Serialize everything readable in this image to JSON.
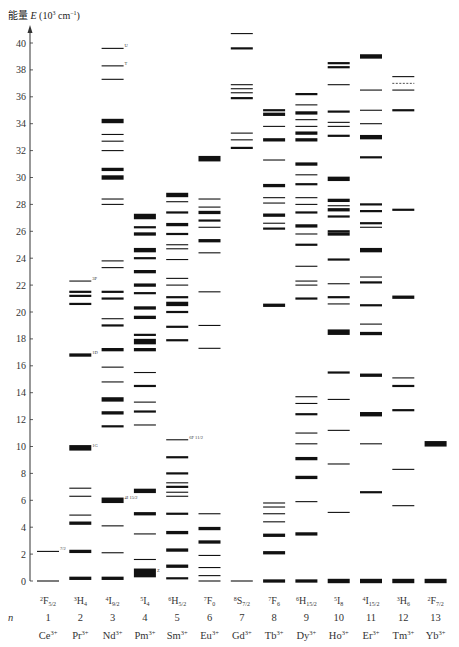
{
  "chart_data": {
    "type": "diagram",
    "ylabel": "能量 E (10^3 cm^-1)",
    "ylabel_parts": {
      "prefix": "能量",
      "var": "E",
      "unit": "(10",
      "exp": "3",
      "unit2": " cm",
      "exp2": "−1",
      "close": ")"
    },
    "ylim": [
      0,
      41
    ],
    "yticks": [
      0,
      2,
      4,
      6,
      8,
      10,
      12,
      14,
      16,
      18,
      20,
      22,
      24,
      26,
      28,
      30,
      32,
      34,
      36,
      38,
      40
    ],
    "row_n_label": "n",
    "ions": [
      {
        "n": "1",
        "ion": "Ce",
        "charge": "3+",
        "ground": "2F",
        "ground_sub": "5/2",
        "levels": [
          {
            "E": 0,
            "w": 1
          },
          {
            "E": 2.2,
            "w": 1,
            "label": "7/2"
          }
        ]
      },
      {
        "n": "2",
        "ion": "Pr",
        "charge": "3+",
        "ground": "3H",
        "ground_sub": "4",
        "levels": [
          {
            "E": 0.2,
            "w": 3
          },
          {
            "E": 2.2,
            "w": 3
          },
          {
            "E": 4.3,
            "w": 3
          },
          {
            "E": 4.9,
            "w": 1
          },
          {
            "E": 6.3,
            "w": 1
          },
          {
            "E": 6.9,
            "w": 1
          },
          {
            "E": 9.9,
            "w": 5,
            "label": "1G"
          },
          {
            "E": 16.8,
            "w": 3,
            "label": "1D"
          },
          {
            "E": 20.6,
            "w": 2
          },
          {
            "E": 21.2,
            "w": 2
          },
          {
            "E": 21.5,
            "w": 2
          },
          {
            "E": 22.3,
            "w": 1,
            "label": "3P"
          },
          {
            "E": 46,
            "w": 1
          }
        ]
      },
      {
        "n": "3",
        "ion": "Nd",
        "charge": "3+",
        "ground": "4I",
        "ground_sub": "9/2",
        "levels": [
          {
            "E": 0.2,
            "w": 3
          },
          {
            "E": 2.1,
            "w": 1
          },
          {
            "E": 4.1,
            "w": 1
          },
          {
            "E": 6.0,
            "w": 5,
            "label": "4I 15/2"
          },
          {
            "E": 11.5,
            "w": 2
          },
          {
            "E": 12.5,
            "w": 3
          },
          {
            "E": 13.5,
            "w": 4
          },
          {
            "E": 14.8,
            "w": 1
          },
          {
            "E": 15.9,
            "w": 1
          },
          {
            "E": 17.2,
            "w": 3
          },
          {
            "E": 19.0,
            "w": 2
          },
          {
            "E": 19.5,
            "w": 1
          },
          {
            "E": 21.0,
            "w": 2
          },
          {
            "E": 21.5,
            "w": 2
          },
          {
            "E": 23.3,
            "w": 1
          },
          {
            "E": 23.8,
            "w": 1
          },
          {
            "E": 28.0,
            "w": 1
          },
          {
            "E": 28.4,
            "w": 1
          },
          {
            "E": 30.0,
            "w": 4
          },
          {
            "E": 30.6,
            "w": 3
          },
          {
            "E": 32.0,
            "w": 1
          },
          {
            "E": 32.7,
            "w": 1
          },
          {
            "E": 33.2,
            "w": 1
          },
          {
            "E": 34.2,
            "w": 4
          },
          {
            "E": 37.3,
            "w": 1
          },
          {
            "E": 38.3,
            "w": 1,
            "label": "T"
          },
          {
            "E": 39.6,
            "w": 1,
            "label": "U"
          }
        ]
      },
      {
        "n": "4",
        "ion": "Pm",
        "charge": "3+",
        "ground": "5I",
        "ground_sub": "4",
        "levels": [
          {
            "E": 0.6,
            "w": 8,
            "label": "Z"
          },
          {
            "E": 1.6,
            "w": 1
          },
          {
            "E": 3.5,
            "w": 1
          },
          {
            "E": 5.0,
            "w": 3
          },
          {
            "E": 6.7,
            "w": 4
          },
          {
            "E": 11.6,
            "w": 1
          },
          {
            "E": 12.6,
            "w": 2
          },
          {
            "E": 13.3,
            "w": 1
          },
          {
            "E": 14.5,
            "w": 2
          },
          {
            "E": 15.5,
            "w": 1
          },
          {
            "E": 17.2,
            "w": 3
          },
          {
            "E": 17.8,
            "w": 5
          },
          {
            "E": 18.3,
            "w": 2
          },
          {
            "E": 19.6,
            "w": 3
          },
          {
            "E": 20.3,
            "w": 3
          },
          {
            "E": 21.4,
            "w": 2
          },
          {
            "E": 22.0,
            "w": 3
          },
          {
            "E": 23.0,
            "w": 3
          },
          {
            "E": 24.0,
            "w": 2
          },
          {
            "E": 24.6,
            "w": 4
          },
          {
            "E": 25.8,
            "w": 3
          },
          {
            "E": 26.3,
            "w": 2
          },
          {
            "E": 27.1,
            "w": 5
          }
        ]
      },
      {
        "n": "5",
        "ion": "Sm",
        "charge": "3+",
        "ground": "6H",
        "ground_sub": "5/2",
        "levels": [
          {
            "E": 0.2,
            "w": 2
          },
          {
            "E": 1.1,
            "w": 3
          },
          {
            "E": 2.3,
            "w": 3
          },
          {
            "E": 3.6,
            "w": 3
          },
          {
            "E": 5.0,
            "w": 2
          },
          {
            "E": 6.3,
            "w": 1
          },
          {
            "E": 6.6,
            "w": 1
          },
          {
            "E": 7.0,
            "w": 2
          },
          {
            "E": 7.3,
            "w": 1
          },
          {
            "E": 8.0,
            "w": 2
          },
          {
            "E": 9.2,
            "w": 2
          },
          {
            "E": 10.5,
            "w": 1,
            "label": "6F 11/2"
          },
          {
            "E": 17.9,
            "w": 2
          },
          {
            "E": 18.9,
            "w": 2
          },
          {
            "E": 20.0,
            "w": 2
          },
          {
            "E": 20.6,
            "w": 4
          },
          {
            "E": 21.1,
            "w": 2
          },
          {
            "E": 22.0,
            "w": 1
          },
          {
            "E": 22.5,
            "w": 1
          },
          {
            "E": 23.9,
            "w": 1
          },
          {
            "E": 24.7,
            "w": 1
          },
          {
            "E": 25.0,
            "w": 1
          },
          {
            "E": 25.8,
            "w": 2
          },
          {
            "E": 26.5,
            "w": 3
          },
          {
            "E": 27.4,
            "w": 2
          },
          {
            "E": 28.2,
            "w": 1
          },
          {
            "E": 28.7,
            "w": 4
          }
        ]
      },
      {
        "n": "6",
        "ion": "Eu",
        "charge": "3+",
        "ground": "7F",
        "ground_sub": "0",
        "levels": [
          {
            "E": 0,
            "w": 1
          },
          {
            "E": 0.4,
            "w": 1
          },
          {
            "E": 1.0,
            "w": 1
          },
          {
            "E": 1.9,
            "w": 1
          },
          {
            "E": 2.9,
            "w": 3
          },
          {
            "E": 3.9,
            "w": 3
          },
          {
            "E": 5.0,
            "w": 1
          },
          {
            "E": 17.3,
            "w": 1
          },
          {
            "E": 19.0,
            "w": 1
          },
          {
            "E": 21.5,
            "w": 1
          },
          {
            "E": 24.4,
            "w": 1
          },
          {
            "E": 25.3,
            "w": 3
          },
          {
            "E": 26.3,
            "w": 1
          },
          {
            "E": 26.8,
            "w": 2
          },
          {
            "E": 27.4,
            "w": 3
          },
          {
            "E": 27.8,
            "w": 1
          },
          {
            "E": 28.4,
            "w": 1
          },
          {
            "E": 31.4,
            "w": 5
          }
        ]
      },
      {
        "n": "7",
        "ion": "Gd",
        "charge": "3+",
        "ground": "8S",
        "ground_sub": "7/2",
        "levels": [
          {
            "E": 0,
            "w": 1
          },
          {
            "E": 32.2,
            "w": 2
          },
          {
            "E": 32.8,
            "w": 1
          },
          {
            "E": 33.3,
            "w": 1
          },
          {
            "E": 35.9,
            "w": 2
          },
          {
            "E": 36.3,
            "w": 1
          },
          {
            "E": 36.6,
            "w": 1
          },
          {
            "E": 36.9,
            "w": 1
          },
          {
            "E": 39.6,
            "w": 2
          },
          {
            "E": 40.7,
            "w": 1
          }
        ]
      },
      {
        "n": "8",
        "ion": "Tb",
        "charge": "3+",
        "ground": "7F",
        "ground_sub": "6",
        "levels": [
          {
            "E": 0,
            "w": 3
          },
          {
            "E": 2.1,
            "w": 3
          },
          {
            "E": 3.4,
            "w": 3
          },
          {
            "E": 4.4,
            "w": 1
          },
          {
            "E": 5.0,
            "w": 1
          },
          {
            "E": 5.5,
            "w": 1
          },
          {
            "E": 5.8,
            "w": 1
          },
          {
            "E": 20.5,
            "w": 3
          },
          {
            "E": 26.2,
            "w": 2
          },
          {
            "E": 26.6,
            "w": 1
          },
          {
            "E": 27.2,
            "w": 3
          },
          {
            "E": 28.1,
            "w": 1
          },
          {
            "E": 28.5,
            "w": 1
          },
          {
            "E": 29.4,
            "w": 3
          },
          {
            "E": 31.3,
            "w": 1
          },
          {
            "E": 32.8,
            "w": 3
          },
          {
            "E": 33.8,
            "w": 1
          },
          {
            "E": 34.7,
            "w": 3
          },
          {
            "E": 35.0,
            "w": 2
          }
        ]
      },
      {
        "n": "9",
        "ion": "Dy",
        "charge": "3+",
        "ground": "6H",
        "ground_sub": "15/2",
        "levels": [
          {
            "E": 0,
            "w": 3
          },
          {
            "E": 3.5,
            "w": 3
          },
          {
            "E": 5.9,
            "w": 1
          },
          {
            "E": 7.7,
            "w": 3
          },
          {
            "E": 9.1,
            "w": 3
          },
          {
            "E": 10.2,
            "w": 1
          },
          {
            "E": 11.0,
            "w": 1
          },
          {
            "E": 12.4,
            "w": 2
          },
          {
            "E": 13.2,
            "w": 1
          },
          {
            "E": 13.7,
            "w": 1
          },
          {
            "E": 21.0,
            "w": 2
          },
          {
            "E": 22.0,
            "w": 1
          },
          {
            "E": 22.3,
            "w": 1
          },
          {
            "E": 23.4,
            "w": 1
          },
          {
            "E": 25.0,
            "w": 2
          },
          {
            "E": 25.8,
            "w": 1
          },
          {
            "E": 26.4,
            "w": 3
          },
          {
            "E": 27.4,
            "w": 2
          },
          {
            "E": 28.0,
            "w": 1
          },
          {
            "E": 28.5,
            "w": 1
          },
          {
            "E": 29.5,
            "w": 2
          },
          {
            "E": 30.2,
            "w": 1
          },
          {
            "E": 31.0,
            "w": 3
          },
          {
            "E": 32.8,
            "w": 3
          },
          {
            "E": 33.3,
            "w": 3
          },
          {
            "E": 33.8,
            "w": 1
          },
          {
            "E": 34.3,
            "w": 1
          },
          {
            "E": 34.8,
            "w": 3
          },
          {
            "E": 36.2,
            "w": 2
          },
          {
            "E": 35.4,
            "w": 1
          }
        ]
      },
      {
        "n": "10",
        "ion": "Ho",
        "charge": "3+",
        "ground": "5I",
        "ground_sub": "8",
        "levels": [
          {
            "E": 0,
            "w": 4
          },
          {
            "E": 5.1,
            "w": 1
          },
          {
            "E": 8.7,
            "w": 1
          },
          {
            "E": 11.2,
            "w": 1
          },
          {
            "E": 13.5,
            "w": 1
          },
          {
            "E": 15.5,
            "w": 2
          },
          {
            "E": 18.5,
            "w": 5
          },
          {
            "E": 20.6,
            "w": 1
          },
          {
            "E": 21.1,
            "w": 2
          },
          {
            "E": 22.1,
            "w": 1
          },
          {
            "E": 23.9,
            "w": 2
          },
          {
            "E": 25.8,
            "w": 3
          },
          {
            "E": 26.0,
            "w": 2
          },
          {
            "E": 27.1,
            "w": 2
          },
          {
            "E": 27.6,
            "w": 3
          },
          {
            "E": 27.9,
            "w": 1
          },
          {
            "E": 28.3,
            "w": 3
          },
          {
            "E": 29.9,
            "w": 4
          },
          {
            "E": 33.1,
            "w": 2
          },
          {
            "E": 33.8,
            "w": 1
          },
          {
            "E": 34.1,
            "w": 1
          },
          {
            "E": 34.9,
            "w": 2
          },
          {
            "E": 36.9,
            "w": 1
          },
          {
            "E": 38.2,
            "w": 2
          },
          {
            "E": 38.5,
            "w": 2
          }
        ]
      },
      {
        "n": "11",
        "ion": "Er",
        "charge": "3+",
        "ground": "4I",
        "ground_sub": "15/2",
        "levels": [
          {
            "E": 0,
            "w": 4
          },
          {
            "E": 6.6,
            "w": 2
          },
          {
            "E": 10.2,
            "w": 1
          },
          {
            "E": 12.4,
            "w": 4
          },
          {
            "E": 15.3,
            "w": 3
          },
          {
            "E": 18.4,
            "w": 3
          },
          {
            "E": 19.1,
            "w": 1
          },
          {
            "E": 20.5,
            "w": 2
          },
          {
            "E": 22.2,
            "w": 2
          },
          {
            "E": 22.6,
            "w": 1
          },
          {
            "E": 24.6,
            "w": 4
          },
          {
            "E": 26.3,
            "w": 1
          },
          {
            "E": 26.6,
            "w": 2
          },
          {
            "E": 27.5,
            "w": 2
          },
          {
            "E": 28.0,
            "w": 2
          },
          {
            "E": 31.5,
            "w": 2
          },
          {
            "E": 33.0,
            "w": 4
          },
          {
            "E": 34.0,
            "w": 1
          },
          {
            "E": 35.0,
            "w": 1
          },
          {
            "E": 36.5,
            "w": 1
          },
          {
            "E": 39.0,
            "w": 4
          }
        ]
      },
      {
        "n": "12",
        "ion": "Tm",
        "charge": "3+",
        "ground": "3H",
        "ground_sub": "6",
        "levels": [
          {
            "E": 0,
            "w": 4
          },
          {
            "E": 5.6,
            "w": 1
          },
          {
            "E": 8.3,
            "w": 1
          },
          {
            "E": 12.7,
            "w": 2
          },
          {
            "E": 14.5,
            "w": 2
          },
          {
            "E": 15.1,
            "w": 1
          },
          {
            "E": 21.1,
            "w": 3
          },
          {
            "E": 27.6,
            "w": 2
          },
          {
            "E": 35.0,
            "w": 2
          },
          {
            "E": 36.5,
            "w": 1
          },
          {
            "E": 37.0,
            "w": 1,
            "dashed": true
          },
          {
            "E": 37.5,
            "w": 1
          }
        ]
      },
      {
        "n": "13",
        "ion": "Yb",
        "charge": "3+",
        "ground": "2F",
        "ground_sub": "7/2",
        "levels": [
          {
            "E": 0,
            "w": 4
          },
          {
            "E": 10.2,
            "w": 5
          }
        ]
      }
    ]
  },
  "axis_label": {
    "prefix": "能量",
    "var": "E"
  }
}
